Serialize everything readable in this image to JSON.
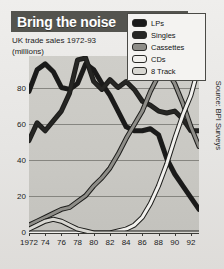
{
  "header": {
    "title": "Bring the noise",
    "subtitle_line1": "UK trade sales 1972-93",
    "subtitle_line2": "(millions)"
  },
  "source": {
    "text": "Source: BPI Surveys"
  },
  "legend": {
    "position": "top-right",
    "items": [
      {
        "label": "LPs",
        "color": "#1a1a1a"
      },
      {
        "label": "Singles",
        "color": "#262624"
      },
      {
        "label": "Cassettes",
        "color": "#8e8d88"
      },
      {
        "label": "CDs",
        "color": "#f2f1ee"
      },
      {
        "label": "8 Track",
        "color": "#d8d7d2"
      }
    ]
  },
  "chart_data": {
    "type": "line",
    "title": "Bring the noise",
    "subtitle": "UK trade sales 1972-93 (millions)",
    "xlabel": "",
    "ylabel": "millions",
    "xlim": [
      1972,
      1993
    ],
    "ylim": [
      0,
      90
    ],
    "yticks": [
      0,
      20,
      40,
      60,
      80
    ],
    "ytick_labels": [
      "0",
      "20",
      "40",
      "60",
      "80"
    ],
    "xticks": [
      1972,
      1974,
      1976,
      1978,
      1980,
      1982,
      1984,
      1986,
      1988,
      1990,
      1992
    ],
    "xtick_labels": [
      "1972",
      "74",
      "76",
      "78",
      "80",
      "82",
      "84",
      "86",
      "88",
      "90",
      "92"
    ],
    "grid": true,
    "x": [
      1972,
      1973,
      1974,
      1975,
      1976,
      1977,
      1978,
      1979,
      1980,
      1981,
      1982,
      1983,
      1984,
      1985,
      1986,
      1987,
      1988,
      1989,
      1990,
      1991,
      1992,
      1993
    ],
    "series": [
      {
        "name": "LPs",
        "color": "#1a1a1a",
        "values": [
          72,
          83,
          86,
          82,
          74,
          73,
          76,
          86,
          83,
          76,
          70,
          62,
          54,
          52,
          52,
          53,
          50,
          38,
          30,
          24,
          18,
          12
        ]
      },
      {
        "name": "Singles",
        "color": "#262624",
        "values": [
          47,
          56,
          52,
          57,
          62,
          71,
          88,
          89,
          77,
          73,
          78,
          74,
          77,
          73,
          67,
          65,
          62,
          61,
          62,
          58,
          52,
          52
        ]
      },
      {
        "name": "Cassettes",
        "color": "#8e8d88",
        "values": [
          4,
          6,
          8,
          10,
          12,
          13,
          16,
          19,
          24,
          28,
          33,
          40,
          48,
          55,
          62,
          72,
          80,
          83,
          76,
          66,
          54,
          44
        ]
      },
      {
        "name": "CDs",
        "color": "#f2f1ee",
        "values": [
          0,
          0,
          0,
          0,
          0,
          0,
          0,
          0,
          0,
          0,
          0,
          1,
          2,
          4,
          8,
          15,
          24,
          35,
          48,
          60,
          70,
          85
        ]
      },
      {
        "name": "8 Track",
        "color": "#d8d7d2",
        "values": [
          2,
          4,
          6,
          7,
          6,
          4,
          2,
          1,
          0,
          0,
          0,
          0,
          0,
          0,
          0,
          0,
          0,
          0,
          0,
          0,
          0,
          0
        ]
      }
    ]
  }
}
